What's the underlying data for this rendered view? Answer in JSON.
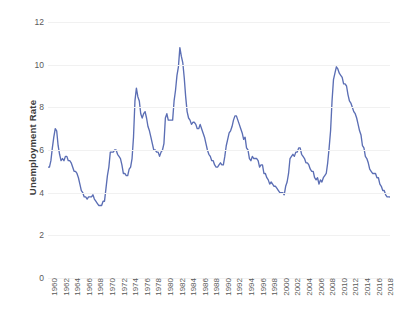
{
  "chart_data": {
    "type": "line",
    "title": "",
    "subtitle": "",
    "xlabel": "",
    "ylabel": "Unemployment Rate",
    "ylim": [
      0,
      12
    ],
    "xlim": [
      1960,
      2019
    ],
    "grid": true,
    "legend": null,
    "legend_position": "none",
    "line_color": "#5B6EB4",
    "y_ticks": [
      0,
      2,
      4,
      6,
      8,
      10,
      12
    ],
    "y_tick_labels": [
      "0",
      "2",
      "4",
      "6",
      "8",
      "10",
      "12"
    ],
    "x_ticks": [
      1960,
      1962,
      1964,
      1966,
      1968,
      1970,
      1972,
      1974,
      1976,
      1978,
      1980,
      1982,
      1984,
      1986,
      1988,
      1990,
      1992,
      1994,
      1996,
      1998,
      2000,
      2002,
      2004,
      2006,
      2008,
      2010,
      2012,
      2014,
      2016,
      2018
    ],
    "x_tick_labels": [
      "1960",
      "1962",
      "1964",
      "1966",
      "1968",
      "1970",
      "1972",
      "1974",
      "1976",
      "1978",
      "1980",
      "1982",
      "1984",
      "1986",
      "1988",
      "1990",
      "1992",
      "1994",
      "1996",
      "1998",
      "2000",
      "2002",
      "2004",
      "2006",
      "2008",
      "2010",
      "2012",
      "2014",
      "2016",
      "2018"
    ],
    "series": [
      {
        "name": "Unemployment Rate",
        "color": "#5B6EB4",
        "x": [
          1960.0,
          1960.25,
          1960.5,
          1960.75,
          1961.0,
          1961.25,
          1961.5,
          1961.75,
          1962.0,
          1962.25,
          1962.5,
          1962.75,
          1963.0,
          1963.25,
          1963.5,
          1963.75,
          1964.0,
          1964.25,
          1964.5,
          1964.75,
          1965.0,
          1965.25,
          1965.5,
          1965.75,
          1966.0,
          1966.25,
          1966.5,
          1966.75,
          1967.0,
          1967.25,
          1967.5,
          1967.75,
          1968.0,
          1968.25,
          1968.5,
          1968.75,
          1969.0,
          1969.25,
          1969.5,
          1969.75,
          1970.0,
          1970.25,
          1970.5,
          1970.75,
          1971.0,
          1971.25,
          1971.5,
          1971.75,
          1972.0,
          1972.25,
          1972.5,
          1972.75,
          1973.0,
          1973.25,
          1973.5,
          1973.75,
          1974.0,
          1974.25,
          1974.5,
          1974.75,
          1975.0,
          1975.25,
          1975.5,
          1975.75,
          1976.0,
          1976.25,
          1976.5,
          1976.75,
          1977.0,
          1977.25,
          1977.5,
          1977.75,
          1978.0,
          1978.25,
          1978.5,
          1978.75,
          1979.0,
          1979.25,
          1979.5,
          1979.75,
          1980.0,
          1980.25,
          1980.5,
          1980.75,
          1981.0,
          1981.25,
          1981.5,
          1981.75,
          1982.0,
          1982.25,
          1982.5,
          1982.75,
          1983.0,
          1983.25,
          1983.5,
          1983.75,
          1984.0,
          1984.25,
          1984.5,
          1984.75,
          1985.0,
          1985.25,
          1985.5,
          1985.75,
          1986.0,
          1986.25,
          1986.5,
          1986.75,
          1987.0,
          1987.25,
          1987.5,
          1987.75,
          1988.0,
          1988.25,
          1988.5,
          1988.75,
          1989.0,
          1989.25,
          1989.5,
          1989.75,
          1990.0,
          1990.25,
          1990.5,
          1990.75,
          1991.0,
          1991.25,
          1991.5,
          1991.75,
          1992.0,
          1992.25,
          1992.5,
          1992.75,
          1993.0,
          1993.25,
          1993.5,
          1993.75,
          1994.0,
          1994.25,
          1994.5,
          1994.75,
          1995.0,
          1995.25,
          1995.5,
          1995.75,
          1996.0,
          1996.25,
          1996.5,
          1996.75,
          1997.0,
          1997.25,
          1997.5,
          1997.75,
          1998.0,
          1998.25,
          1998.5,
          1998.75,
          1999.0,
          1999.25,
          1999.5,
          1999.75,
          2000.0,
          2000.25,
          2000.5,
          2000.75,
          2001.0,
          2001.25,
          2001.5,
          2001.75,
          2002.0,
          2002.25,
          2002.5,
          2002.75,
          2003.0,
          2003.25,
          2003.5,
          2003.75,
          2004.0,
          2004.25,
          2004.5,
          2004.75,
          2005.0,
          2005.25,
          2005.5,
          2005.75,
          2006.0,
          2006.25,
          2006.5,
          2006.75,
          2007.0,
          2007.25,
          2007.5,
          2007.75,
          2008.0,
          2008.25,
          2008.5,
          2008.75,
          2009.0,
          2009.25,
          2009.5,
          2009.75,
          2010.0,
          2010.25,
          2010.5,
          2010.75,
          2011.0,
          2011.25,
          2011.5,
          2011.75,
          2012.0,
          2012.25,
          2012.5,
          2012.75,
          2013.0,
          2013.25,
          2013.5,
          2013.75,
          2014.0,
          2014.25,
          2014.5,
          2014.75,
          2015.0,
          2015.25,
          2015.5,
          2015.75,
          2016.0,
          2016.25,
          2016.5,
          2016.75,
          2017.0,
          2017.25,
          2017.5,
          2017.75,
          2018.0,
          2018.25,
          2018.5,
          2018.75,
          2019.0,
          2019.25
        ],
        "values": [
          5.2,
          5.2,
          5.5,
          6.1,
          6.6,
          7.0,
          6.9,
          6.2,
          5.8,
          5.5,
          5.6,
          5.5,
          5.7,
          5.7,
          5.5,
          5.5,
          5.4,
          5.2,
          5.0,
          5.0,
          4.9,
          4.7,
          4.4,
          4.1,
          4.0,
          3.8,
          3.8,
          3.7,
          3.8,
          3.8,
          3.8,
          3.9,
          3.7,
          3.6,
          3.5,
          3.4,
          3.4,
          3.4,
          3.6,
          3.6,
          4.2,
          4.8,
          5.2,
          5.9,
          5.9,
          5.9,
          6.0,
          6.0,
          5.8,
          5.7,
          5.6,
          5.3,
          4.9,
          4.9,
          4.8,
          4.8,
          5.1,
          5.2,
          5.6,
          6.6,
          8.3,
          8.9,
          8.5,
          8.3,
          7.7,
          7.5,
          7.7,
          7.8,
          7.5,
          7.1,
          6.9,
          6.6,
          6.3,
          6.0,
          6.0,
          5.9,
          5.9,
          5.7,
          5.9,
          6.0,
          6.3,
          7.5,
          7.7,
          7.4,
          7.4,
          7.4,
          7.4,
          8.3,
          8.8,
          9.5,
          9.9,
          10.8,
          10.4,
          10.1,
          9.4,
          8.5,
          7.8,
          7.5,
          7.4,
          7.2,
          7.3,
          7.3,
          7.2,
          7.0,
          7.0,
          7.2,
          7.0,
          6.8,
          6.6,
          6.3,
          6.0,
          5.8,
          5.7,
          5.5,
          5.5,
          5.3,
          5.2,
          5.2,
          5.3,
          5.4,
          5.3,
          5.3,
          5.7,
          6.2,
          6.5,
          6.8,
          6.9,
          7.1,
          7.4,
          7.6,
          7.6,
          7.4,
          7.2,
          7.0,
          6.8,
          6.5,
          6.6,
          6.1,
          6.0,
          5.6,
          5.5,
          5.7,
          5.6,
          5.6,
          5.6,
          5.5,
          5.2,
          5.3,
          5.3,
          4.9,
          4.9,
          4.7,
          4.6,
          4.4,
          4.5,
          4.4,
          4.3,
          4.3,
          4.2,
          4.1,
          4.0,
          4.0,
          4.0,
          3.9,
          4.3,
          4.5,
          4.9,
          5.6,
          5.7,
          5.8,
          5.7,
          5.9,
          5.9,
          6.1,
          6.1,
          5.8,
          5.7,
          5.6,
          5.4,
          5.4,
          5.3,
          5.1,
          5.0,
          5.0,
          4.7,
          4.6,
          4.7,
          4.4,
          4.6,
          4.5,
          4.7,
          4.8,
          4.9,
          5.4,
          6.1,
          6.9,
          8.3,
          9.3,
          9.6,
          9.9,
          9.8,
          9.6,
          9.5,
          9.4,
          9.1,
          9.1,
          9.0,
          8.6,
          8.3,
          8.2,
          8.0,
          7.8,
          7.7,
          7.5,
          7.2,
          6.9,
          6.7,
          6.2,
          6.1,
          5.7,
          5.6,
          5.4,
          5.1,
          5.0,
          4.9,
          4.9,
          4.9,
          4.7,
          4.7,
          4.4,
          4.3,
          4.1,
          4.1,
          3.9,
          3.8,
          3.8,
          3.8,
          3.7
        ]
      }
    ]
  },
  "axes": {
    "y_title": "Unemployment Rate"
  }
}
